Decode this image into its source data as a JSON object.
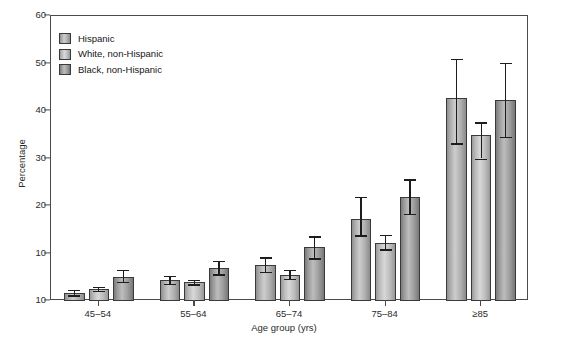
{
  "chart_data": {
    "type": "bar",
    "title": "",
    "xlabel": "Age group (yrs)",
    "ylabel": "Percentage",
    "categories": [
      "45–54",
      "55–64",
      "65–74",
      "75–84",
      "≥85"
    ],
    "ylim": [
      0,
      60
    ],
    "yticks": [
      0,
      10,
      20,
      30,
      40,
      50,
      60
    ],
    "ytick_labels": [
      "10",
      "10",
      "20",
      "30",
      "40",
      "50",
      "60"
    ],
    "grid": false,
    "legend_position": "top-left",
    "series": [
      {
        "name": "Hispanic",
        "values": [
          1.7,
          4.4,
          7.5,
          17.3,
          42.8
        ],
        "err_low": [
          1.2,
          3.6,
          6.2,
          13.8,
          33.2
        ],
        "err_high": [
          2.3,
          5.3,
          9.2,
          22.0,
          51.0
        ]
      },
      {
        "name": "White, non-Hispanic",
        "values": [
          2.5,
          3.9,
          5.5,
          12.3,
          35.0
        ],
        "err_low": [
          2.1,
          3.5,
          4.6,
          10.9,
          30.0
        ],
        "err_high": [
          3.0,
          4.4,
          6.6,
          14.0,
          37.6
        ]
      },
      {
        "name": "Black, non-Hispanic",
        "values": [
          5.0,
          7.0,
          11.3,
          22.0,
          42.4
        ],
        "err_low": [
          4.0,
          5.6,
          9.0,
          18.4,
          34.5
        ],
        "err_high": [
          6.6,
          8.5,
          13.6,
          25.6,
          50.2
        ]
      }
    ]
  },
  "legend": {
    "items": [
      {
        "label": "Hispanic"
      },
      {
        "label": "White, non-Hispanic"
      },
      {
        "label": "Black, non-Hispanic"
      }
    ]
  },
  "colors": {
    "axis": "#4a4a4a",
    "text": "#1a1a1a",
    "bar_light": "#d8d8d8",
    "bar_mid": "#bdbdbd",
    "bar_dark": "#7c7c7c",
    "error_bar": "#1d1d1d"
  }
}
